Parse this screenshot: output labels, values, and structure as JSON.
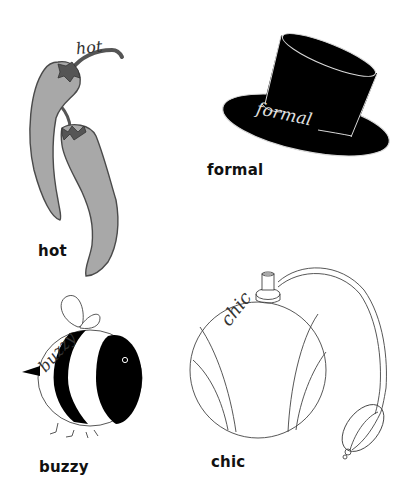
{
  "colors": {
    "background": "#ffffff",
    "pepper_fill": "#a8a8a8",
    "pepper_stem": "#555555",
    "ink": "#111111",
    "hat_fill": "#000000",
    "hat_outline": "#d8d8d8"
  },
  "items": [
    {
      "id": "hot",
      "illustration": "chili-peppers",
      "script_text": "hot",
      "label": "hot"
    },
    {
      "id": "formal",
      "illustration": "top-hat",
      "script_text": "formal",
      "label": "formal"
    },
    {
      "id": "buzzy",
      "illustration": "bumblebee",
      "script_text": "buzzy",
      "label": "buzzy"
    },
    {
      "id": "chic",
      "illustration": "perfume-atomizer",
      "script_text": "chic",
      "label": "chic"
    }
  ]
}
